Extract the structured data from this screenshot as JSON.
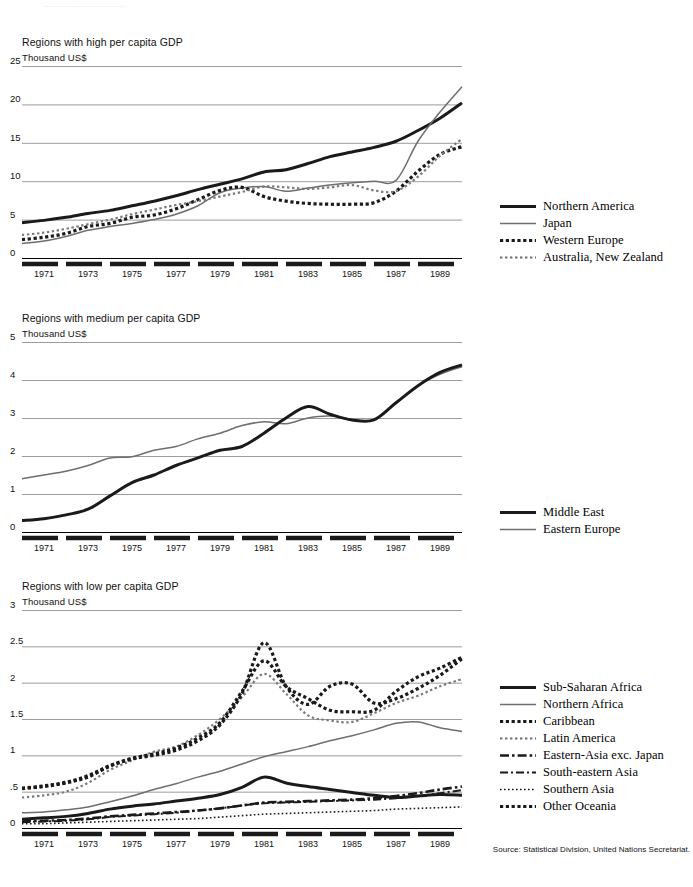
{
  "top_strip_text": "......................................",
  "source": "Source: Statistical Division, United Nations Secretariat.",
  "panels": [
    {
      "id": "high",
      "title": "Regions with high per capita GDP",
      "unit": "Thousand US$",
      "yticks": [
        "0",
        "5",
        "10",
        "15",
        "20",
        "25"
      ],
      "xticks": [
        "1971",
        "1973",
        "1975",
        "1977",
        "1979",
        "1981",
        "1983",
        "1985",
        "1987",
        "1989"
      ],
      "legend": [
        {
          "label": "Northern America",
          "style": "solid-thick",
          "color": "#1a1a1a"
        },
        {
          "label": "Japan",
          "style": "solid-thin",
          "color": "#6e6e6e"
        },
        {
          "label": "Western Europe",
          "style": "dotted-thick",
          "color": "#1a1a1a"
        },
        {
          "label": "Australia, New Zealand",
          "style": "dotted-thin",
          "color": "#6e6e6e"
        }
      ]
    },
    {
      "id": "medium",
      "title": "Regions with medium per capita GDP",
      "unit": "Thousand US$",
      "yticks": [
        "0",
        "1",
        "2",
        "3",
        "4",
        "5"
      ],
      "xticks": [
        "1971",
        "1973",
        "1975",
        "1977",
        "1979",
        "1981",
        "1983",
        "1985",
        "1987",
        "1989"
      ],
      "legend": [
        {
          "label": "Middle East",
          "style": "solid-thick",
          "color": "#1a1a1a"
        },
        {
          "label": "Eastern Europe",
          "style": "solid-thin",
          "color": "#6e6e6e"
        }
      ]
    },
    {
      "id": "low",
      "title": "Regions with low per capita GDP",
      "unit": "Thousand US$",
      "yticks": [
        "0",
        ".5",
        "1",
        "1.5",
        "2",
        "2.5",
        "3"
      ],
      "xticks": [
        "1971",
        "1973",
        "1975",
        "1977",
        "1979",
        "1981",
        "1983",
        "1985",
        "1987",
        "1989"
      ],
      "legend": [
        {
          "label": "Sub-Saharan Africa",
          "style": "solid-thick",
          "color": "#1a1a1a"
        },
        {
          "label": "Northern Africa",
          "style": "solid-thin",
          "color": "#6e6e6e"
        },
        {
          "label": "Caribbean",
          "style": "dotted-thick",
          "color": "#1a1a1a"
        },
        {
          "label": "Latin America",
          "style": "dotted-thin",
          "color": "#6e6e6e"
        },
        {
          "label": "Eastern-Asia exc. Japan",
          "style": "dashdot-thick",
          "color": "#1a1a1a"
        },
        {
          "label": "South-eastern Asia",
          "style": "dashdot-thin",
          "color": "#1a1a1a"
        },
        {
          "label": "Southern Asia",
          "style": "dotted-fine",
          "color": "#1a1a1a"
        },
        {
          "label": "Other Oceania",
          "style": "dotted-thick",
          "color": "#1a1a1a"
        }
      ]
    }
  ],
  "chart_data": [
    {
      "type": "line",
      "title": "Regions with high per capita GDP",
      "xlabel": "",
      "ylabel": "Thousand US$",
      "ylim": [
        0,
        25
      ],
      "xlim": [
        1970,
        1990
      ],
      "grid": true,
      "legend_position": "right",
      "x": [
        1970,
        1971,
        1972,
        1973,
        1974,
        1975,
        1976,
        1977,
        1978,
        1979,
        1980,
        1981,
        1982,
        1983,
        1984,
        1985,
        1986,
        1987,
        1988,
        1989,
        1990
      ],
      "series": [
        {
          "name": "Northern America",
          "values": [
            4.6,
            4.9,
            5.3,
            5.8,
            6.2,
            6.8,
            7.4,
            8.1,
            8.9,
            9.6,
            10.3,
            11.2,
            11.5,
            12.3,
            13.2,
            13.8,
            14.4,
            15.2,
            16.6,
            18.2,
            20.2
          ]
        },
        {
          "name": "Japan",
          "values": [
            1.9,
            2.2,
            2.8,
            3.6,
            4.1,
            4.5,
            5.0,
            5.7,
            6.8,
            8.5,
            9.1,
            9.3,
            8.7,
            9.1,
            9.5,
            9.8,
            10.0,
            10.1,
            15.2,
            19.0,
            22.3
          ]
        },
        {
          "name": "Western Europe",
          "values": [
            2.4,
            2.7,
            3.2,
            4.1,
            4.5,
            5.3,
            5.6,
            6.4,
            7.6,
            8.8,
            9.2,
            8.0,
            7.4,
            7.1,
            7.0,
            7.0,
            7.2,
            8.7,
            11.3,
            13.5,
            14.5
          ]
        },
        {
          "name": "Australia, New Zealand",
          "values": [
            3.0,
            3.3,
            3.8,
            4.4,
            5.0,
            5.7,
            6.3,
            6.9,
            7.4,
            8.0,
            8.6,
            9.3,
            9.2,
            9.0,
            9.2,
            9.5,
            8.8,
            8.7,
            10.6,
            13.3,
            15.5
          ]
        }
      ]
    },
    {
      "type": "line",
      "title": "Regions with medium per capita GDP",
      "xlabel": "",
      "ylabel": "Thousand US$",
      "ylim": [
        0,
        5
      ],
      "xlim": [
        1970,
        1990
      ],
      "grid": true,
      "legend_position": "right",
      "x": [
        1970,
        1971,
        1972,
        1973,
        1974,
        1975,
        1976,
        1977,
        1978,
        1979,
        1980,
        1981,
        1982,
        1983,
        1984,
        1985,
        1986,
        1987,
        1988,
        1989,
        1990
      ],
      "series": [
        {
          "name": "Middle East",
          "values": [
            0.3,
            0.35,
            0.45,
            0.6,
            0.95,
            1.3,
            1.5,
            1.75,
            1.95,
            2.15,
            2.25,
            2.6,
            3.0,
            3.3,
            3.1,
            2.95,
            2.95,
            3.4,
            3.85,
            4.2,
            4.4
          ]
        },
        {
          "name": "Eastern Europe",
          "values": [
            1.4,
            1.5,
            1.6,
            1.75,
            1.95,
            1.98,
            2.15,
            2.25,
            2.45,
            2.6,
            2.8,
            2.9,
            2.85,
            3.0,
            3.05,
            2.95,
            2.95,
            3.4,
            3.85,
            4.15,
            4.35
          ]
        }
      ]
    },
    {
      "type": "line",
      "title": "Regions with low per capita GDP",
      "xlabel": "",
      "ylabel": "Thousand US$",
      "ylim": [
        0,
        3
      ],
      "xlim": [
        1970,
        1990
      ],
      "grid": true,
      "legend_position": "right",
      "x": [
        1970,
        1971,
        1972,
        1973,
        1974,
        1975,
        1976,
        1977,
        1978,
        1979,
        1980,
        1981,
        1982,
        1983,
        1984,
        1985,
        1986,
        1987,
        1988,
        1989,
        1990
      ],
      "series": [
        {
          "name": "Sub-Saharan Africa",
          "values": [
            0.12,
            0.14,
            0.16,
            0.2,
            0.26,
            0.3,
            0.33,
            0.37,
            0.41,
            0.46,
            0.56,
            0.7,
            0.62,
            0.57,
            0.53,
            0.49,
            0.45,
            0.42,
            0.44,
            0.46,
            0.45
          ]
        },
        {
          "name": "Northern Africa",
          "values": [
            0.21,
            0.22,
            0.25,
            0.29,
            0.36,
            0.44,
            0.53,
            0.61,
            0.7,
            0.78,
            0.88,
            0.98,
            1.05,
            1.12,
            1.2,
            1.27,
            1.35,
            1.44,
            1.46,
            1.38,
            1.33
          ]
        },
        {
          "name": "Caribbean",
          "values": [
            0.54,
            0.57,
            0.62,
            0.7,
            0.85,
            0.95,
            1.0,
            1.07,
            1.2,
            1.42,
            1.85,
            2.55,
            1.95,
            1.7,
            1.95,
            1.98,
            1.72,
            1.78,
            1.92,
            2.1,
            2.33
          ]
        },
        {
          "name": "Latin America",
          "values": [
            0.42,
            0.45,
            0.5,
            0.62,
            0.8,
            0.93,
            1.05,
            1.12,
            1.28,
            1.5,
            1.8,
            2.12,
            1.85,
            1.55,
            1.48,
            1.46,
            1.58,
            1.72,
            1.82,
            1.95,
            2.05
          ]
        },
        {
          "name": "Eastern-Asia exc. Japan",
          "values": [
            0.09,
            0.1,
            0.11,
            0.13,
            0.16,
            0.18,
            0.2,
            0.22,
            0.24,
            0.27,
            0.31,
            0.35,
            0.36,
            0.37,
            0.38,
            0.39,
            0.41,
            0.44,
            0.48,
            0.53,
            0.57
          ]
        },
        {
          "name": "South-eastern Asia",
          "values": [
            0.08,
            0.09,
            0.1,
            0.12,
            0.15,
            0.17,
            0.19,
            0.21,
            0.24,
            0.27,
            0.31,
            0.34,
            0.35,
            0.36,
            0.37,
            0.38,
            0.39,
            0.41,
            0.44,
            0.48,
            0.52
          ]
        },
        {
          "name": "Southern Asia",
          "values": [
            0.55,
            0.58,
            0.63,
            0.72,
            0.86,
            0.96,
            1.02,
            1.1,
            1.24,
            1.45,
            1.88,
            2.3,
            1.95,
            1.78,
            1.62,
            1.6,
            1.62,
            1.88,
            2.08,
            2.2,
            2.35
          ]
        },
        {
          "name": "Other Oceania",
          "values": [
            0.06,
            0.06,
            0.07,
            0.08,
            0.09,
            0.1,
            0.11,
            0.12,
            0.13,
            0.15,
            0.17,
            0.19,
            0.2,
            0.21,
            0.22,
            0.23,
            0.24,
            0.26,
            0.27,
            0.28,
            0.29
          ]
        }
      ]
    }
  ]
}
